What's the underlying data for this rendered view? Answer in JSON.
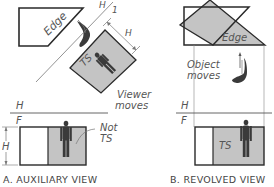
{
  "colors": {
    "line": "#2a2a2a",
    "thin_line": "#777777",
    "fill_gray": "#c4c4c4",
    "text": "#555555",
    "figure": "#3a3a3a"
  },
  "panel_a": {
    "caption": "A. AUXILIARY VIEW",
    "edge_label": "Edge",
    "fold_label_top": "H",
    "fold_label_bottom": "1",
    "dim_label": "H",
    "ts_label": "TS",
    "viewer_label_line1": "Viewer",
    "viewer_label_line2": "moves",
    "fold_h": "H",
    "fold_f": "F",
    "height_dim": "H",
    "not_ts_line1": "Not",
    "not_ts_line2": "TS"
  },
  "panel_b": {
    "caption": "B. REVOLVED VIEW",
    "edge_label": "Edge",
    "object_label_line1": "Object",
    "object_label_line2": "moves",
    "fold_h": "H",
    "fold_f": "F",
    "ts_label": "TS"
  }
}
